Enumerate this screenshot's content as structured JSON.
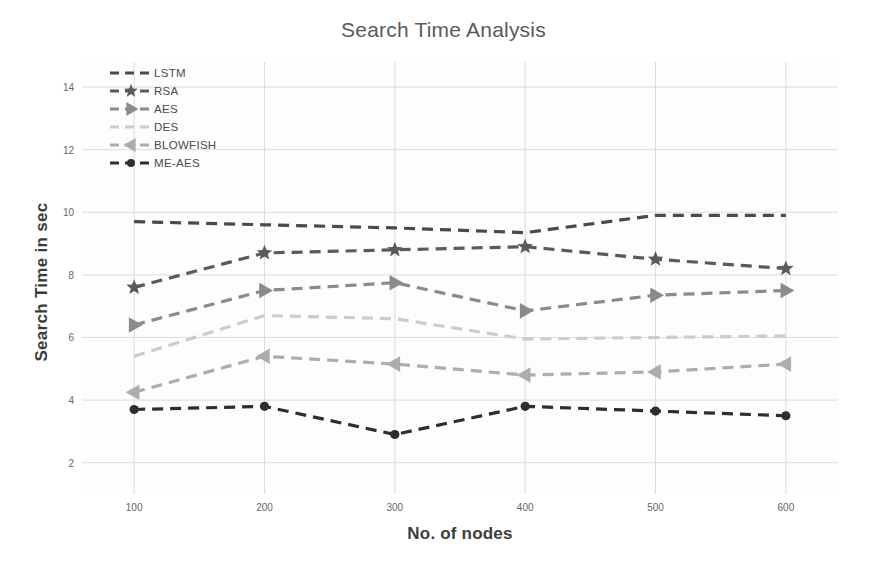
{
  "chart_data": {
    "type": "line",
    "title": "Search Time Analysis",
    "xlabel": "No. of nodes",
    "ylabel": "Search Time in sec",
    "x": [
      100,
      200,
      300,
      400,
      500,
      600
    ],
    "xticklabels": [
      "100",
      "200",
      "300",
      "400",
      "500",
      "600"
    ],
    "yticks": [
      2,
      4,
      6,
      8,
      10,
      12,
      14
    ],
    "yticklabels": [
      "2",
      "4",
      "6",
      "8",
      "10",
      "12",
      "14"
    ],
    "xlim": [
      60,
      640
    ],
    "ylim": [
      1.0,
      14.8
    ],
    "grid": true,
    "legend_position": "upper left",
    "series": [
      {
        "name": "LSTM",
        "values": [
          9.7,
          9.6,
          9.5,
          9.35,
          9.9,
          9.9
        ],
        "color": "#4a4a4a",
        "marker": "none",
        "linestyle": "dashed"
      },
      {
        "name": "RSA",
        "values": [
          7.6,
          8.7,
          8.8,
          8.9,
          8.5,
          8.2
        ],
        "color": "#5a5a5a",
        "marker": "star",
        "linestyle": "dashed"
      },
      {
        "name": "AES",
        "values": [
          6.4,
          7.5,
          7.75,
          6.85,
          7.35,
          7.5
        ],
        "color": "#8a8a8a",
        "marker": "triangle-right",
        "linestyle": "dashed"
      },
      {
        "name": "DES",
        "values": [
          5.4,
          6.7,
          6.6,
          5.95,
          6.0,
          6.05
        ],
        "color": "#cccccc",
        "marker": "none",
        "linestyle": "dashed"
      },
      {
        "name": "BLOWFISH",
        "values": [
          4.25,
          5.4,
          5.15,
          4.8,
          4.9,
          5.15
        ],
        "color": "#adadad",
        "marker": "triangle-left",
        "linestyle": "dashed"
      },
      {
        "name": "ME-AES",
        "values": [
          3.7,
          3.8,
          2.9,
          3.8,
          3.65,
          3.5
        ],
        "color": "#2e2e2e",
        "marker": "circle",
        "linestyle": "dashed"
      }
    ]
  },
  "legend": {
    "items": [
      {
        "label": "LSTM"
      },
      {
        "label": "RSA"
      },
      {
        "label": "AES"
      },
      {
        "label": "DES"
      },
      {
        "label": "BLOWFISH"
      },
      {
        "label": "ME-AES"
      }
    ]
  },
  "colors": {
    "grid": "#d8d8d8",
    "background": "#ffffff",
    "plot_background": "#fdfdfd",
    "title": "#5a5a5a",
    "axis_label": "#3c3c3c",
    "tick": "#666666"
  }
}
